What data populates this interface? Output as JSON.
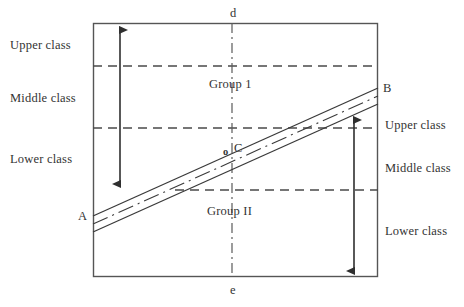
{
  "diagram": {
    "colors": {
      "frame": "#555555",
      "line": "#3a3a3a",
      "dashed": "#4a4a4a",
      "axis": "#5a5a5a",
      "arrow": "#2f2f2f",
      "text": "#333333",
      "background": "#ffffff"
    },
    "frame": {
      "x": 93,
      "y": 23,
      "width": 285,
      "height": 254
    },
    "left_labels": [
      {
        "id": "upper-left",
        "text": "Upper class"
      },
      {
        "id": "middle-left",
        "text": "Middle class"
      },
      {
        "id": "lower-left",
        "text": "Lower class"
      }
    ],
    "right_labels": [
      {
        "id": "upper-right",
        "text": "Upper class"
      },
      {
        "id": "middle-right",
        "text": "Middle class"
      },
      {
        "id": "lower-right",
        "text": "Lower class"
      }
    ],
    "group_labels": [
      {
        "id": "group-1",
        "text": "Group 1"
      },
      {
        "id": "group-2",
        "text": "Group II"
      }
    ],
    "point_labels": [
      {
        "id": "point-a",
        "text": "A"
      },
      {
        "id": "point-b",
        "text": "B"
      },
      {
        "id": "point-c",
        "text": "C"
      },
      {
        "id": "point-o",
        "text": "o"
      }
    ],
    "axis_labels": [
      {
        "id": "axis-top",
        "text": "d"
      },
      {
        "id": "axis-bottom",
        "text": "e"
      }
    ],
    "dashed_lines": [
      {
        "id": "boundary-upper-middle-left",
        "y": 66,
        "x1": 93,
        "x2": 378
      },
      {
        "id": "boundary-middle-lower-left",
        "y": 128,
        "x1": 93,
        "x2": 378
      },
      {
        "id": "boundary-middle-lower-right",
        "y": 190,
        "x1": 175,
        "x2": 378
      }
    ],
    "trend_lines": [
      {
        "id": "line-group-1-upper",
        "x1": 93,
        "y1": 216,
        "x2": 378,
        "y2": 88,
        "style": "solid"
      },
      {
        "id": "line-group-2-lower",
        "x1": 93,
        "y1": 232,
        "x2": 378,
        "y2": 104,
        "style": "solid"
      },
      {
        "id": "line-dash-dot-mid",
        "x1": 93,
        "y1": 224,
        "x2": 378,
        "y2": 96,
        "style": "dash-dot"
      }
    ],
    "center_axis": {
      "id": "center-axis-de",
      "x": 232,
      "y1": 23,
      "y2": 277,
      "style": "dash-dot"
    },
    "arrows": [
      {
        "id": "arrow-left-range",
        "x": 120,
        "y1": 28,
        "y2": 186,
        "heads": "both"
      },
      {
        "id": "arrow-right-range",
        "x": 354,
        "y1": 118,
        "y2": 273,
        "heads": "both"
      }
    ]
  }
}
